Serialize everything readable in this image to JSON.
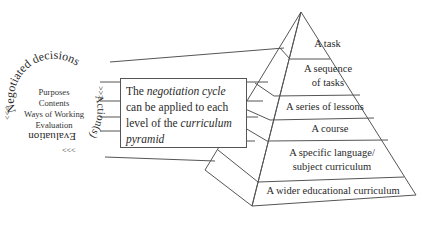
{
  "cycle": {
    "arc_top": "Negotiated decisions",
    "arc_right": "Action(s)",
    "arc_bottom": "Evaluation",
    "arrows_right": ">>>",
    "arrows_bottom": "<<<",
    "arrows_left": "<<<",
    "inner_items": [
      "Purposes",
      "Contents",
      "Ways of Working",
      "Evaluation"
    ]
  },
  "callout": {
    "part1": "The ",
    "part2_italic": "negotiation cycle",
    "part3": " can be applied to each level of the ",
    "part4_italic": "curriculum pyramid"
  },
  "pyramid": {
    "levels": [
      "A task",
      "A sequence of tasks",
      "A series of lessons",
      "A course",
      "A specific language/ subject curriculum",
      "A wider educational curriculum"
    ],
    "levels_display": [
      [
        "A task"
      ],
      [
        "A sequence",
        "of tasks"
      ],
      [
        "A series of lessons"
      ],
      [
        "A course"
      ],
      [
        "A specific language/",
        "subject curriculum"
      ],
      [
        "A wider educational curriculum"
      ]
    ]
  },
  "colors": {
    "line": "#555555",
    "text": "#2a2a2a",
    "background": "#ffffff"
  }
}
